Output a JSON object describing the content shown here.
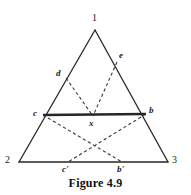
{
  "figure": {
    "caption": "Figure 4.9",
    "stroke_color": "#262626",
    "label_color": "#1a1a1a",
    "background_color": "#ffffff"
  },
  "vertices": [
    {
      "id": "apex",
      "label": "1",
      "x": 95,
      "y": 30,
      "label_x": 92,
      "label_y": 13
    },
    {
      "id": "bottom-left",
      "label": "2",
      "x": 19,
      "y": 162,
      "label_x": 5,
      "label_y": 157
    },
    {
      "id": "bottom-right",
      "label": "3",
      "x": 168,
      "y": 162,
      "label_x": 172,
      "label_y": 157
    }
  ],
  "points": [
    {
      "id": "d",
      "label": "d",
      "x": 66,
      "y": 78,
      "label_x": 56,
      "label_y": 70
    },
    {
      "id": "e",
      "label": "e",
      "x": 117,
      "y": 62,
      "label_x": 119,
      "label_y": 52
    },
    {
      "id": "c",
      "label": "c",
      "x": 43,
      "y": 115,
      "label_x": 33,
      "label_y": 110
    },
    {
      "id": "b",
      "label": "b",
      "x": 146,
      "y": 114,
      "label_x": 149,
      "label_y": 107
    },
    {
      "id": "x",
      "label": "x",
      "x": 93,
      "y": 115,
      "label_x": 89,
      "label_y": 119
    },
    {
      "id": "c-prime",
      "label": "c'",
      "x": 68,
      "y": 162,
      "label_x": 63,
      "label_y": 166
    },
    {
      "id": "b-prime",
      "label": "b'",
      "x": 122,
      "y": 162,
      "label_x": 117,
      "label_y": 166
    }
  ],
  "edges": {
    "solid": [
      {
        "id": "edge-1-2",
        "from": "apex",
        "to": "bottom-left",
        "x1": 95,
        "y1": 30,
        "x2": 19,
        "y2": 162,
        "width": 1.3
      },
      {
        "id": "edge-1-3",
        "from": "apex",
        "to": "bottom-right",
        "x1": 95,
        "y1": 30,
        "x2": 168,
        "y2": 162,
        "width": 1.3
      },
      {
        "id": "edge-2-3",
        "from": "bottom-left",
        "to": "bottom-right",
        "x1": 19,
        "y1": 162,
        "x2": 168,
        "y2": 162,
        "width": 1.3
      },
      {
        "id": "edge-c-b",
        "from": "c",
        "to": "b",
        "x1": 43,
        "y1": 115,
        "x2": 146,
        "y2": 114,
        "width": 2.4
      }
    ],
    "dashed": [
      {
        "id": "edge-d-x",
        "from": "d",
        "to": "x",
        "x1": 66,
        "y1": 78,
        "x2": 93,
        "y2": 116
      },
      {
        "id": "edge-e-x",
        "from": "e",
        "to": "x",
        "x1": 117,
        "y1": 62,
        "x2": 93,
        "y2": 116
      },
      {
        "id": "edge-c-bprime",
        "from": "c",
        "to": "b-prime",
        "x1": 43,
        "y1": 115,
        "x2": 122,
        "y2": 162
      },
      {
        "id": "edge-b-cprime",
        "from": "b",
        "to": "c-prime",
        "x1": 146,
        "y1": 114,
        "x2": 68,
        "y2": 162
      }
    ]
  }
}
